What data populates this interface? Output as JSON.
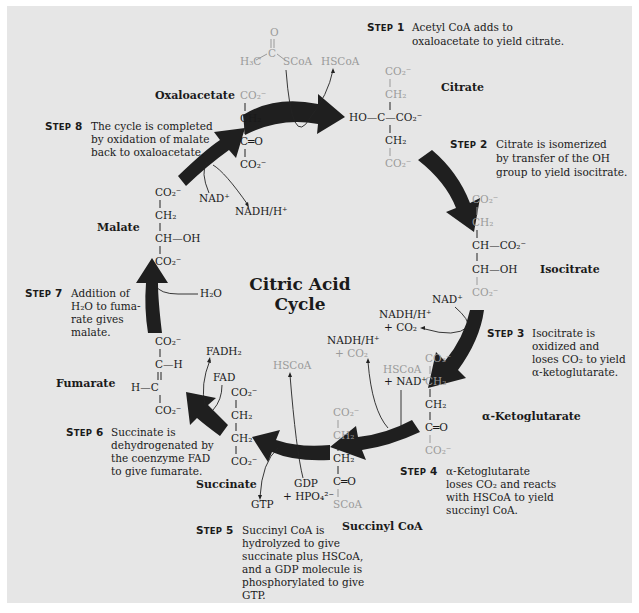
{
  "title": {
    "line1": "Citric Acid",
    "line2": "Cycle"
  },
  "colors": {
    "background": "#e6e6e6",
    "arrow": "#1f1f1f",
    "text": "#1a1a1a",
    "faded_atoms": "#9a9a9a"
  },
  "steps": [
    {
      "label": "STEP 1",
      "lines": [
        "Acetyl CoA adds to",
        "oxaloacetate to yield citrate."
      ]
    },
    {
      "label": "STEP 2",
      "lines": [
        "Citrate is isomerized",
        "by transfer of the OH",
        "group to yield  isocitrate."
      ]
    },
    {
      "label": "STEP 3",
      "lines": [
        "Isocitrate is",
        "oxidized and",
        "loses CO₂ to yield",
        "α-ketoglutarate."
      ]
    },
    {
      "label": "STEP 4",
      "lines": [
        "α-Ketoglutarate",
        "loses CO₂ and reacts",
        "with HSCoA to yield",
        "succinyl CoA."
      ]
    },
    {
      "label": "STEP 5",
      "lines": [
        "Succinyl CoA is",
        "hydrolyzed to give",
        "succinate plus HSCoA,",
        "and a GDP molecule is",
        "phosphorylated to give",
        "GTP."
      ]
    },
    {
      "label": "STEP 6",
      "lines": [
        "Succinate is",
        "dehydrogenated by",
        "the coenzyme FAD",
        "to give fumarate."
      ]
    },
    {
      "label": "STEP 7",
      "lines": [
        "Addition of",
        "H₂O to fuma-",
        "rate gives",
        "malate."
      ]
    },
    {
      "label": "STEP 8",
      "lines": [
        "The cycle is completed",
        "by oxidation of malate",
        "back to oxaloacetate."
      ]
    }
  ],
  "compounds": {
    "oxaloacetate": "Oxaloacetate",
    "citrate": "Citrate",
    "isocitrate": "Isocitrate",
    "ketoglutarate": "α-Ketoglutarate",
    "succinyl_coa": "Succinyl CoA",
    "succinate": "Succinate",
    "fumarate": "Fumarate",
    "malate": "Malate"
  },
  "groups": {
    "co2m": "CO₂⁻",
    "ch2": "CH₂",
    "co": "C═O",
    "c": "C",
    "ch_oh": "CH—OH",
    "ch_co2m": "CH—CO₂⁻",
    "ho_c_co2m": "HO—C—CO₂⁻",
    "c_h": "C—H",
    "h_c": "H—C",
    "scoa": "SCoA",
    "h3c": "H₃C",
    "o": "O"
  },
  "reagents": {
    "hscoa_out1": "HSCoA",
    "acetyl_scoa": "SCoA",
    "nad_3": "NAD⁺",
    "nadh_3": "NADH/H⁺",
    "co2_3": "+  CO₂",
    "nadh_4": "NADH/H⁺",
    "co2_4": "+  CO₂",
    "hscoa_4": "HSCoA",
    "nad_4": "+ NAD⁺",
    "hscoa_5": "HSCoA",
    "gdp_5": "GDP",
    "hpo4_5": "+ HPO₄²⁻",
    "gtp_5": "GTP",
    "fad_6": "FAD",
    "fadh2_6": "FADH₂",
    "h2o_7": "H₂O",
    "nad_8": "NAD⁺",
    "nadh_8": "NADH/H⁺"
  }
}
